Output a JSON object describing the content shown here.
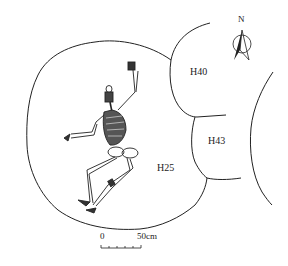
{
  "figure": {
    "type": "archaeological burial pit plan",
    "features": [
      {
        "id": "H25",
        "label": "H25"
      },
      {
        "id": "H40",
        "label": "H40"
      },
      {
        "id": "H43",
        "label": "H43"
      }
    ],
    "north_arrow": {
      "label": "N"
    },
    "scale_bar": {
      "start_label": "0",
      "end_label": "50cm"
    },
    "colors": {
      "line": "#222222",
      "background": "#ffffff",
      "bone_shade": "#333333"
    }
  }
}
